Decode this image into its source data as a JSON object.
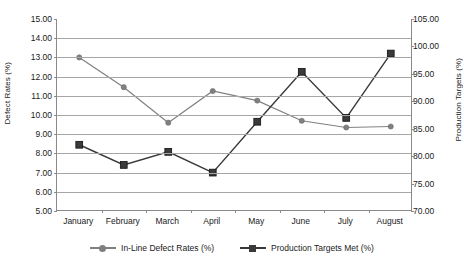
{
  "chart_data": {
    "type": "line",
    "title": "",
    "xlabel": "",
    "categories": [
      "January",
      "February",
      "March",
      "April",
      "May",
      "June",
      "July",
      "August"
    ],
    "grid": true,
    "legend_position": "bottom",
    "axes": {
      "left": {
        "label": "Defect Rates (%)",
        "ylim": [
          5.0,
          15.0
        ],
        "step": 1.0,
        "ticks": [
          "5.00",
          "6.00",
          "7.00",
          "8.00",
          "9.00",
          "10.00",
          "11.00",
          "12.00",
          "13.00",
          "14.00",
          "15.00"
        ]
      },
      "right": {
        "label": "Production Targets (%)",
        "ylim": [
          70.0,
          105.0
        ],
        "step": 5.0,
        "ticks": [
          "70.00",
          "75.00",
          "80.00",
          "85.00",
          "90.00",
          "95.00",
          "100.00",
          "105.00"
        ]
      }
    },
    "series": [
      {
        "name": "In-Line Defect Rates (%)",
        "axis": "left",
        "color": "#808080",
        "marker": "circle",
        "values": [
          13.0,
          11.45,
          9.6,
          11.25,
          10.75,
          9.7,
          9.35,
          9.4
        ]
      },
      {
        "name": "Production Targets Met (%)",
        "axis": "right",
        "color": "#3a3a3a",
        "marker": "square",
        "values": [
          82.1,
          78.4,
          80.8,
          77.0,
          86.3,
          95.4,
          87.0,
          98.6
        ],
        "values_left_scale": [
          8.45,
          7.4,
          8.08,
          7.0,
          9.65,
          12.25,
          9.85,
          13.2
        ]
      }
    ]
  },
  "legend": {
    "items": [
      {
        "label": "In-Line Defect Rates (%)",
        "color": "#808080",
        "marker": "circle"
      },
      {
        "label": "Production Targets Met (%)",
        "color": "#3a3a3a",
        "marker": "square"
      }
    ]
  }
}
